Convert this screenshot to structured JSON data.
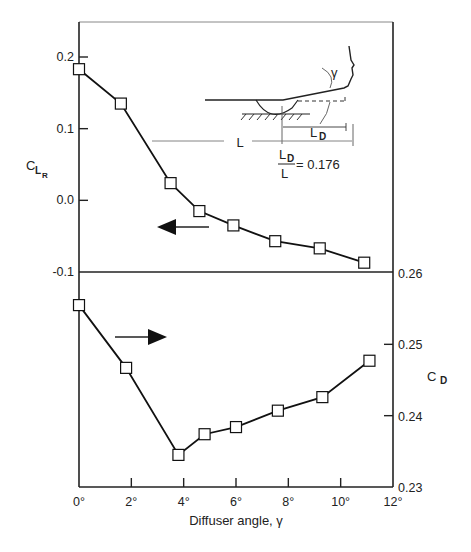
{
  "chart_data": {
    "type": "line",
    "title": "",
    "xlabel": "Diffuser angle, γ",
    "x_ticks": [
      "0°",
      "2°",
      "4°",
      "6°",
      "8°",
      "10°",
      "12°"
    ],
    "xlim": [
      0,
      12
    ],
    "grid": false,
    "legend": "none",
    "upper_panel": {
      "ylabel_main": "C",
      "ylabel_sub": "L",
      "ylabel_subsub": "R",
      "axis_side": "left",
      "ylim": [
        -0.1,
        0.25
      ],
      "y_ticks": [
        "0.2",
        "0.1",
        "0.0",
        "-0.1"
      ],
      "arrow_direction": "left",
      "series": [
        {
          "name": "C_LR",
          "marker": "open-square",
          "x": [
            0,
            1.6,
            3.5,
            4.6,
            5.9,
            7.5,
            9.2,
            10.9
          ],
          "values": [
            0.183,
            0.135,
            0.024,
            -0.015,
            -0.035,
            -0.057,
            -0.067,
            -0.087
          ]
        }
      ]
    },
    "lower_panel": {
      "ylabel_main": "C",
      "ylabel_sub": "D",
      "axis_side": "right",
      "ylim": [
        0.23,
        0.26
      ],
      "y_ticks": [
        "0.26",
        "0.25",
        "0.24",
        "0.23"
      ],
      "arrow_direction": "right",
      "series": [
        {
          "name": "C_D",
          "marker": "open-square",
          "x": [
            0,
            1.8,
            3.8,
            4.8,
            6.0,
            7.6,
            9.3,
            11.1
          ],
          "values": [
            0.2555,
            0.2467,
            0.2345,
            0.2374,
            0.2384,
            0.2407,
            0.2426,
            0.2477
          ]
        }
      ]
    },
    "inset_diagram": {
      "angle_label": "γ",
      "length_label": "L",
      "diffuser_length_label": "L",
      "diffuser_length_sub": "D",
      "ratio_numerator": "L",
      "ratio_numerator_sub": "D",
      "ratio_denominator": "L",
      "ratio_value": "= 0.176"
    }
  }
}
